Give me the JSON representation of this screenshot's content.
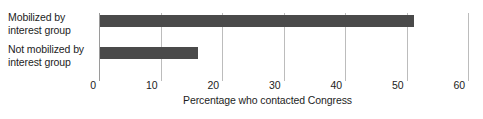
{
  "chart_data": {
    "type": "bar",
    "orientation": "horizontal",
    "title": "",
    "xlabel": "Percentage who contacted Congress",
    "ylabel": "",
    "categories": [
      "Mobilized by interest group",
      "Not mobilized by interest group"
    ],
    "category_lines": [
      [
        "Mobilized by",
        "interest group"
      ],
      [
        "Not mobilized by",
        "interest group"
      ]
    ],
    "values": [
      51,
      16
    ],
    "xlim": [
      0,
      62
    ],
    "xticks": [
      0,
      10,
      20,
      30,
      40,
      50,
      60
    ],
    "xtick_labels": [
      "0",
      "10",
      "20",
      "30",
      "40",
      "50",
      "60"
    ],
    "grid": "vertical-only",
    "legend": "none",
    "colors": {
      "bar": "#4a4a4a",
      "gridline": "#bcbcbc",
      "axis": "#9a9a9a",
      "text": "#1d1d1d",
      "background": "#ffffff"
    }
  }
}
